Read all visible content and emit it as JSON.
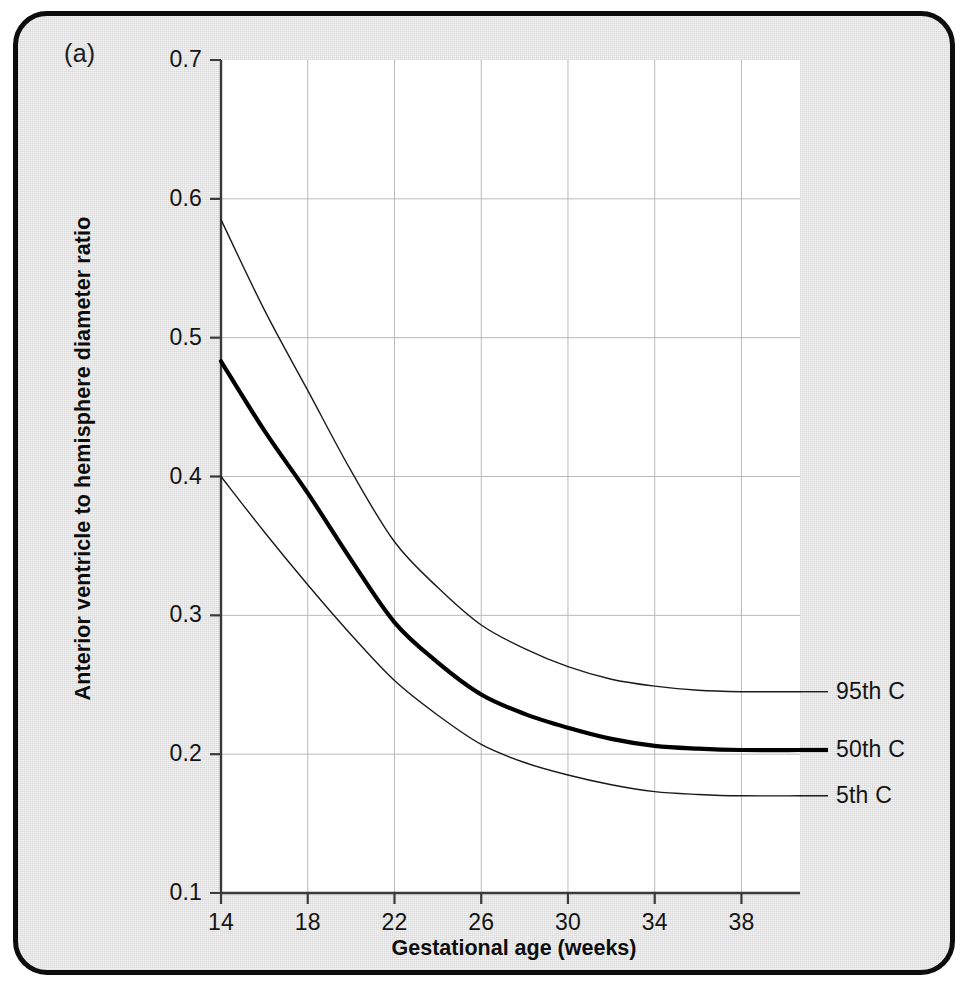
{
  "figure": {
    "panel_label": "(a)",
    "frame_color": "#0d0d0d",
    "background_color": "#e9e9e9",
    "plot_background_color": "#ffffff"
  },
  "chart_data": {
    "type": "line",
    "title": "",
    "xlabel": "Gestational age (weeks)",
    "ylabel": "Anterior ventricle to hemisphere diameter ratio",
    "xlim": [
      14,
      40.7
    ],
    "ylim": [
      0.1,
      0.7
    ],
    "xticks": [
      14,
      18,
      22,
      26,
      30,
      34,
      38
    ],
    "yticks": [
      0.1,
      0.2,
      0.3,
      0.4,
      0.5,
      0.6,
      0.7
    ],
    "xtick_labels": [
      "14",
      "18",
      "22",
      "26",
      "30",
      "34",
      "38"
    ],
    "ytick_labels": [
      "0.1",
      "0.2",
      "0.3",
      "0.4",
      "0.5",
      "0.6",
      "0.7"
    ],
    "grid": true,
    "legend_position": "right-inline",
    "x": [
      14,
      16,
      18,
      20,
      22,
      24,
      26,
      28,
      30,
      32,
      34,
      36,
      38,
      40.7
    ],
    "series": [
      {
        "name": "95th C",
        "label": "95th C",
        "line_width": 1.4,
        "color": "#1a1a1a",
        "values": [
          0.585,
          0.52,
          0.462,
          0.404,
          0.353,
          0.32,
          0.293,
          0.276,
          0.263,
          0.254,
          0.249,
          0.246,
          0.245,
          0.245
        ]
      },
      {
        "name": "50th C",
        "label": "50th C",
        "line_width": 4.2,
        "color": "#000000",
        "values": [
          0.483,
          0.433,
          0.388,
          0.34,
          0.295,
          0.266,
          0.243,
          0.229,
          0.219,
          0.211,
          0.206,
          0.204,
          0.203,
          0.203
        ]
      },
      {
        "name": "5th C",
        "label": "5th C",
        "line_width": 1.4,
        "color": "#1a1a1a",
        "values": [
          0.4,
          0.36,
          0.322,
          0.286,
          0.253,
          0.228,
          0.207,
          0.194,
          0.185,
          0.178,
          0.173,
          0.171,
          0.17,
          0.17
        ]
      }
    ]
  }
}
